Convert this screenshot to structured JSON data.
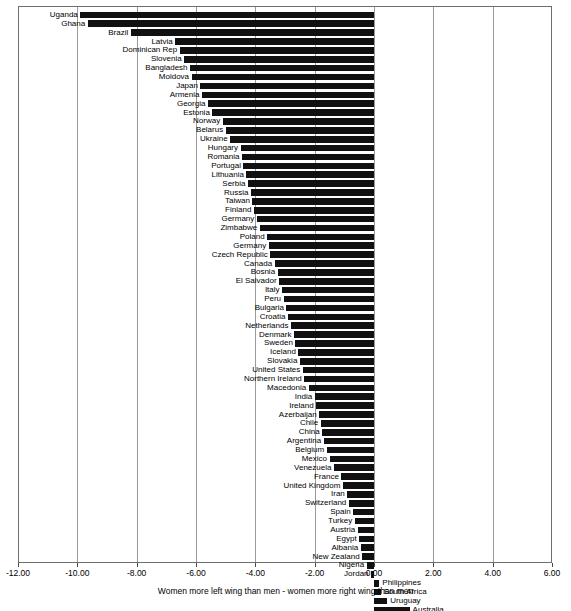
{
  "chart_data": {
    "type": "bar",
    "orientation": "horizontal",
    "title": "",
    "subtitle": "",
    "xlabel": "Women more left wing than men - women more right wing than men",
    "ylabel": "",
    "xlim": [
      -12.0,
      6.0
    ],
    "xticks": [
      -12.0,
      -10.0,
      -8.0,
      -6.0,
      -4.0,
      -2.0,
      0.0,
      2.0,
      4.0,
      6.0
    ],
    "xtick_labels": [
      "-12.00",
      "-10.00",
      "-8.00",
      "-6.00",
      "-4.00",
      "-2.00",
      "0.00",
      "2.00",
      "4.00",
      "6.00"
    ],
    "grid": true,
    "grid_axis": "x",
    "legend": null,
    "bar_color": "#111111",
    "categories": [
      "Uganda",
      "Ghana",
      "Brazil",
      "Latvia",
      "Dominican Rep",
      "Slovenia",
      "Bangladesh",
      "Moldova",
      "Japan",
      "Armenia",
      "Georgia",
      "Estonia",
      "Norway",
      "Belarus",
      "Ukraine",
      "Hungary",
      "Romania",
      "Portugal",
      "Lithuania",
      "Serbia",
      "Russia",
      "Taiwan",
      "Finland",
      "Germany",
      "Zimbabwe",
      "Poland",
      "Germany",
      "Czech Republic",
      "Canada",
      "Bosnia",
      "El Salvador",
      "Italy",
      "Peru",
      "Bulgaria",
      "Croatia",
      "Netherlands",
      "Denmark",
      "Sweden",
      "Iceland",
      "Slovakia",
      "United States",
      "Northern Ireland",
      "Macedonia",
      "India",
      "Ireland",
      "Azerbaijan",
      "Chile",
      "China",
      "Argentina",
      "Belgium",
      "Mexico",
      "Venezuela",
      "France",
      "United Kingdom",
      "Iran",
      "Switzerland",
      "Spain",
      "Turkey",
      "Austria",
      "Egypt",
      "Albania",
      "New Zealand",
      "Nigeria",
      "Jordan",
      "Philippines",
      "South Africa",
      "Uruguay",
      "Australia",
      "Korea, Rep. of",
      "Vietnam"
    ],
    "values": [
      -9.9,
      -9.65,
      -8.2,
      -6.7,
      -6.55,
      -6.4,
      -6.2,
      -6.15,
      -5.85,
      -5.8,
      -5.6,
      -5.45,
      -5.1,
      -5.0,
      -4.85,
      -4.5,
      -4.45,
      -4.4,
      -4.3,
      -4.25,
      -4.15,
      -4.1,
      -4.05,
      -3.95,
      -3.85,
      -3.6,
      -3.55,
      -3.5,
      -3.35,
      -3.25,
      -3.2,
      -3.1,
      -3.05,
      -2.95,
      -2.9,
      -2.8,
      -2.7,
      -2.65,
      -2.55,
      -2.5,
      -2.4,
      -2.35,
      -2.2,
      -2.0,
      -1.95,
      -1.85,
      -1.8,
      -1.75,
      -1.7,
      -1.6,
      -1.5,
      -1.35,
      -1.1,
      -1.05,
      -0.9,
      -0.85,
      -0.7,
      -0.65,
      -0.55,
      -0.5,
      -0.45,
      -0.4,
      -0.25,
      -0.1,
      0.18,
      0.22,
      0.45,
      1.2,
      1.65,
      2.3
    ]
  }
}
